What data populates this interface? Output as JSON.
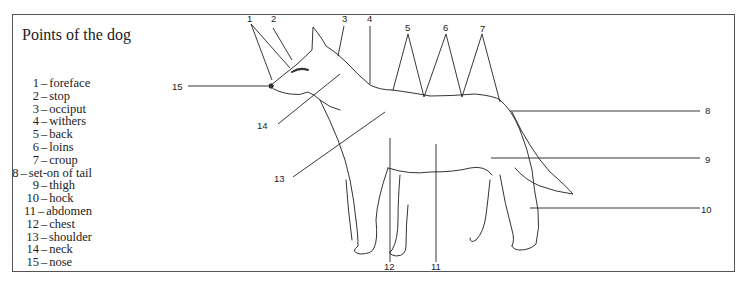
{
  "title": "Points of the dog",
  "legend": [
    {
      "num": "1",
      "label": "foreface"
    },
    {
      "num": "2",
      "label": "stop"
    },
    {
      "num": "3",
      "label": "occiput"
    },
    {
      "num": "4",
      "label": "withers"
    },
    {
      "num": "5",
      "label": "back"
    },
    {
      "num": "6",
      "label": "loins"
    },
    {
      "num": "7",
      "label": "croup"
    },
    {
      "num": "8",
      "label": "set-on of tail"
    },
    {
      "num": "9",
      "label": "thigh"
    },
    {
      "num": "10",
      "label": "hock"
    },
    {
      "num": "11",
      "label": "abdomen"
    },
    {
      "num": "12",
      "label": "chest"
    },
    {
      "num": "13",
      "label": "shoulder"
    },
    {
      "num": "14",
      "label": "neck"
    },
    {
      "num": "15",
      "label": "nose"
    }
  ],
  "callouts": {
    "c1": "1",
    "c2": "2",
    "c3": "3",
    "c4": "4",
    "c5": "5",
    "c6": "6",
    "c7": "7",
    "c8": "8",
    "c9": "9",
    "c10": "10",
    "c11": "11",
    "c12": "12",
    "c13": "13",
    "c14": "14",
    "c15": "15"
  },
  "separator": "–"
}
